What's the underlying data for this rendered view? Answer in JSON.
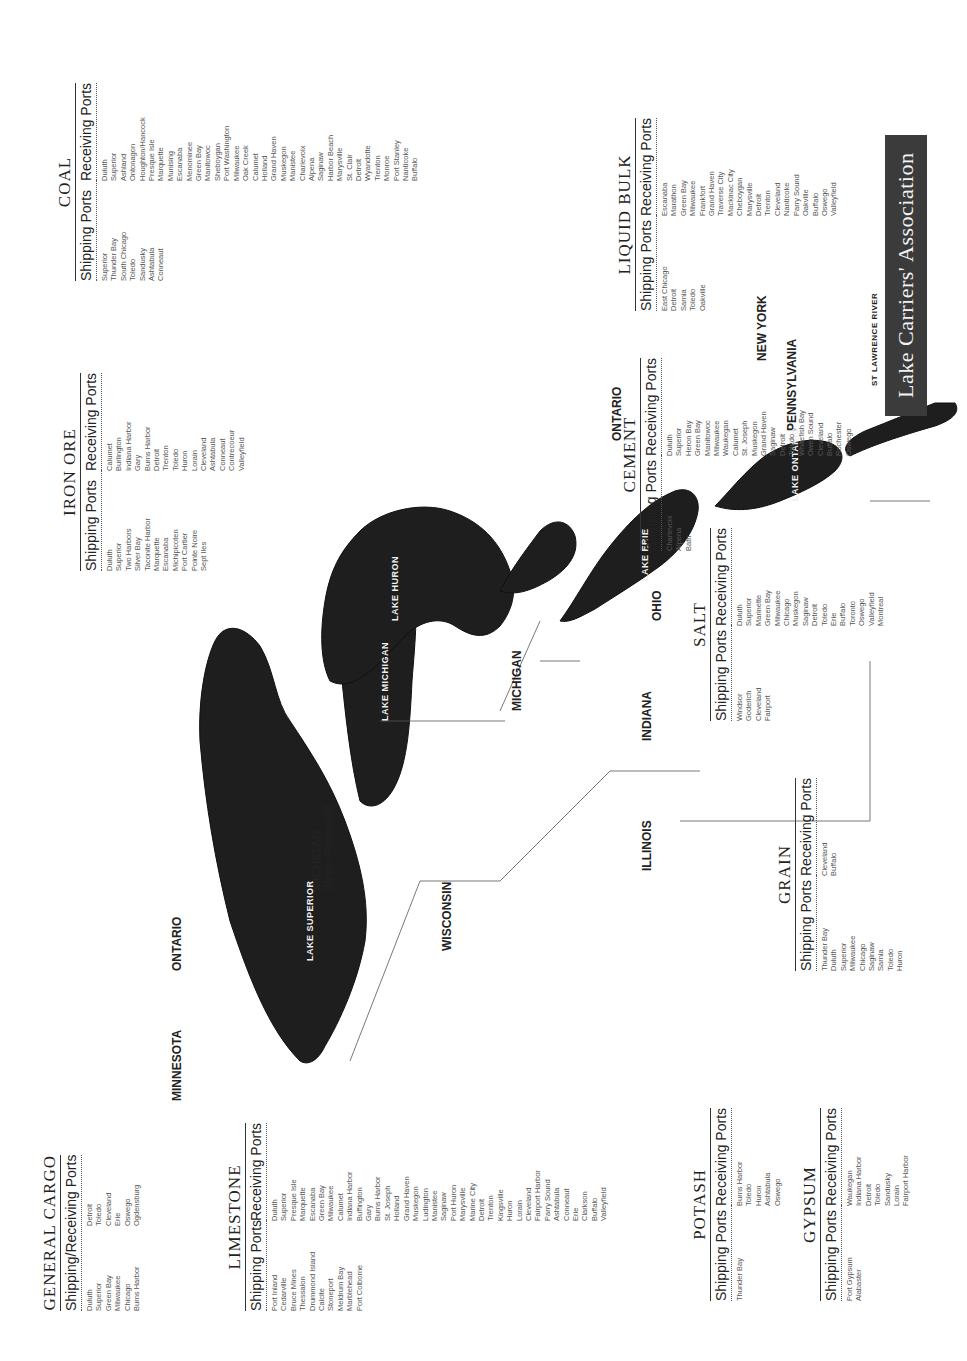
{
  "title": "Lake Carriers' Association",
  "map": {
    "regions": [
      "MINNESOTA",
      "ONTARIO",
      "MICHIGAN",
      "(Upper Peninsula)",
      "WISCONSIN",
      "ILLINOIS",
      "INDIANA",
      "MICHIGAN",
      "OHIO",
      "ONTARIO",
      "PENNSYLVANIA",
      "NEW YORK"
    ],
    "lakes": [
      "LAKE SUPERIOR",
      "LAKE MICHIGAN",
      "LAKE HURON",
      "LAKE ERIE",
      "LAKE ONTARIO",
      "ST LAWRENCE RIVER"
    ]
  },
  "tables": {
    "general_cargo": {
      "title": "GENERAL CARGO",
      "header": "Shipping/Receiving Ports",
      "col1": [
        "Duluth",
        "Superior",
        "Green Bay",
        "Milwaukee",
        "Chicago",
        "Burns Harbor"
      ],
      "col2": [
        "Detroit",
        "Toledo",
        "Cleveland",
        "Erie",
        "Oswego",
        "Ogdensburg"
      ]
    },
    "limestone": {
      "title": "LIMESTONE",
      "shipping_header": "Shipping Ports",
      "receiving_header": "Receiving Ports",
      "shipping": [
        "Port Inland",
        "Cedarville",
        "Bruce Mines",
        "Thessalon",
        "Drummond Island",
        "Calcite",
        "Stoneport",
        "Meldrum Bay",
        "Marblehead",
        "Port Colborne"
      ],
      "receiving": [
        "Duluth",
        "Superior",
        "Presque Isle",
        "Marquette",
        "Escanaba",
        "Green Bay",
        "Milwaukee",
        "Calumet",
        "Indiana Harbor",
        "Buffington",
        "Gary",
        "Burns Harbor",
        "St. Joseph",
        "Holland",
        "Grand Haven",
        "Muskegon",
        "Ludington",
        "Manistee",
        "Saginaw",
        "Port Huron",
        "Marysville",
        "Marine City",
        "Detroit",
        "Trenton",
        "Kingsville",
        "Huron",
        "Lorain",
        "Cleveland",
        "Fairport Harbor",
        "Parry Sound",
        "Ashtabula",
        "Conneaut",
        "Erie",
        "Clarkson",
        "Buffalo",
        "Valleyfield"
      ]
    },
    "potash": {
      "title": "POTASH",
      "shipping_header": "Shipping Ports",
      "receiving_header": "Receiving Ports",
      "shipping": [
        "Thunder Bay"
      ],
      "receiving": [
        "Burns Harbor",
        "Toledo",
        "Huron",
        "Ashtabula",
        "Oswego"
      ]
    },
    "gypsum": {
      "title": "GYPSUM",
      "shipping_header": "Shipping Ports",
      "receiving_header": "Receiving Ports",
      "shipping": [
        "Port Gypsum",
        "Alabaster"
      ],
      "receiving": [
        "Waukegan",
        "Indiana Harbor",
        "Detroit",
        "Toledo",
        "Sandusky",
        "Lorain",
        "Fairport Harbor"
      ]
    },
    "grain": {
      "title": "GRAIN",
      "shipping_header": "Shipping Ports",
      "receiving_header": "Receiving Ports",
      "shipping": [
        "Thunder Bay",
        "Duluth",
        "Superior",
        "Milwaukee",
        "Chicago",
        "Saginaw",
        "Sarnia",
        "Toledo",
        "Huron"
      ],
      "receiving": [
        "Cleveland",
        "Buffalo"
      ]
    },
    "salt": {
      "title": "SALT",
      "shipping_header": "Shipping Ports",
      "receiving_header": "Receiving Ports",
      "shipping": [
        "Windsor",
        "Goderich",
        "Cleveland",
        "Fairport"
      ],
      "receiving": [
        "Duluth",
        "Superior",
        "Marinette",
        "Green Bay",
        "Milwaukee",
        "Chicago",
        "Muskegon",
        "Saginaw",
        "Detroit",
        "Toledo",
        "Erie",
        "Buffalo",
        "Toronto",
        "Oswego",
        "Valleyfield",
        "Montreal"
      ]
    },
    "cement": {
      "title": "CEMENT",
      "shipping_header": "Shipping Ports",
      "receiving_header": "Receiving Ports",
      "shipping": [
        "Charlevoix",
        "Alpena",
        "Bath"
      ],
      "receiving": [
        "Duluth",
        "Superior",
        "Heron Bay",
        "Green Bay",
        "Manitowoc",
        "Milwaukee",
        "Waukegan",
        "Calumet",
        "St. Joseph",
        "Muskegon",
        "Grand Haven",
        "Saginaw",
        "Detroit",
        "Toledo",
        "Whitefish Bay",
        "Owen Sound",
        "Cleveland",
        "Buffalo",
        "Rochester",
        "Oswego"
      ]
    },
    "liquid_bulk": {
      "title": "LIQUID BULK",
      "shipping_header": "Shipping Ports",
      "receiving_header": "Receiving Ports",
      "shipping": [
        "East Chicago",
        "Detroit",
        "Sarnia",
        "Toledo",
        "Oakville"
      ],
      "receiving": [
        "Escanaba",
        "Marathon",
        "Green Bay",
        "Milwaukee",
        "Frankfort",
        "Grand Haven",
        "Traverse City",
        "Mackinac City",
        "Cheboygan",
        "Marysville",
        "Detroit",
        "Trenton",
        "Cleveland",
        "Nanticoke",
        "Parry Sound",
        "Oakville",
        "Buffalo",
        "Oswego",
        "Valleyfield"
      ]
    },
    "iron_ore": {
      "title": "IRON ORE",
      "shipping_header": "Shipping Ports",
      "receiving_header": "Receiving Ports",
      "shipping": [
        "Duluth",
        "Superior",
        "Two Harbors",
        "Silver Bay",
        "Taconite Harbor",
        "Marquette",
        "Escanaba",
        "Michipicoten",
        "Port Cartier",
        "Pointe Noire",
        "Sept Iles"
      ],
      "receiving": [
        "Calumet",
        "Burlington",
        "Indiana Harbor",
        "Gary",
        "Burns Harbor",
        "Detroit",
        "Trenton",
        "Toledo",
        "Huron",
        "Lorain",
        "Cleveland",
        "Ashtabula",
        "Conneaut",
        "Contrecoeur",
        "Valleyfield"
      ]
    },
    "coal": {
      "title": "COAL",
      "shipping_header": "Shipping Ports",
      "receiving_header": "Receiving Ports",
      "shipping": [
        "Superior",
        "Thunder Bay",
        "South Chicago",
        "Toledo",
        "Sandusky",
        "Ashtabula",
        "Conneaut"
      ],
      "receiving": [
        "Duluth",
        "Superior",
        "Ashland",
        "Ontonagon",
        "Houghton/Hancock",
        "Presque Isle",
        "Marquette",
        "Munising",
        "Escanaba",
        "Menominee",
        "Green Bay",
        "Manitowoc",
        "Sheboygan",
        "Port Washington",
        "Milwaukee",
        "Oak Creek",
        "Calumet",
        "Holland",
        "Grand Haven",
        "Muskegon",
        "Manistee",
        "Charlevoix",
        "Alpena",
        "Saginaw",
        "Harbor Beach",
        "Marysville",
        "St. Clair",
        "Detroit",
        "Wyandotte",
        "Trenton",
        "Monroe",
        "Port Stanley",
        "Nanticoke",
        "Buffalo"
      ]
    }
  }
}
